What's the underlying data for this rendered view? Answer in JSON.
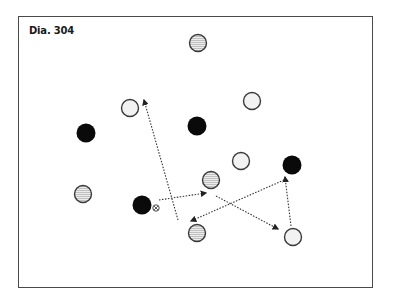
{
  "diagram": {
    "title": "Dia. 304",
    "colors": {
      "frame": "#4a4a4a",
      "black_player": "#0a0a0a",
      "white_player_fill": "#f2f2f2",
      "striped_player_fill": "#e8e8e8",
      "outline": "#3a3a3a",
      "arrow": "#333333"
    },
    "players": {
      "black": [
        {
          "x": 86,
          "y": 133
        },
        {
          "x": 197,
          "y": 126
        },
        {
          "x": 292,
          "y": 165
        },
        {
          "x": 142,
          "y": 205
        }
      ],
      "white": [
        {
          "x": 130,
          "y": 108
        },
        {
          "x": 252,
          "y": 101
        },
        {
          "x": 241,
          "y": 161
        },
        {
          "x": 293,
          "y": 237
        }
      ],
      "striped": [
        {
          "x": 198,
          "y": 43
        },
        {
          "x": 83,
          "y": 194
        },
        {
          "x": 211,
          "y": 180
        },
        {
          "x": 197,
          "y": 233
        }
      ]
    },
    "ball": {
      "x": 156,
      "y": 208,
      "icon": "ball-icon"
    },
    "arrows": [
      {
        "x1": 178,
        "y1": 220,
        "x2": 144,
        "y2": 100
      },
      {
        "x1": 159,
        "y1": 200,
        "x2": 206,
        "y2": 193
      },
      {
        "x1": 216,
        "y1": 196,
        "x2": 278,
        "y2": 229
      },
      {
        "x1": 284,
        "y1": 180,
        "x2": 191,
        "y2": 221
      },
      {
        "x1": 291,
        "y1": 226,
        "x2": 285,
        "y2": 177
      }
    ]
  }
}
